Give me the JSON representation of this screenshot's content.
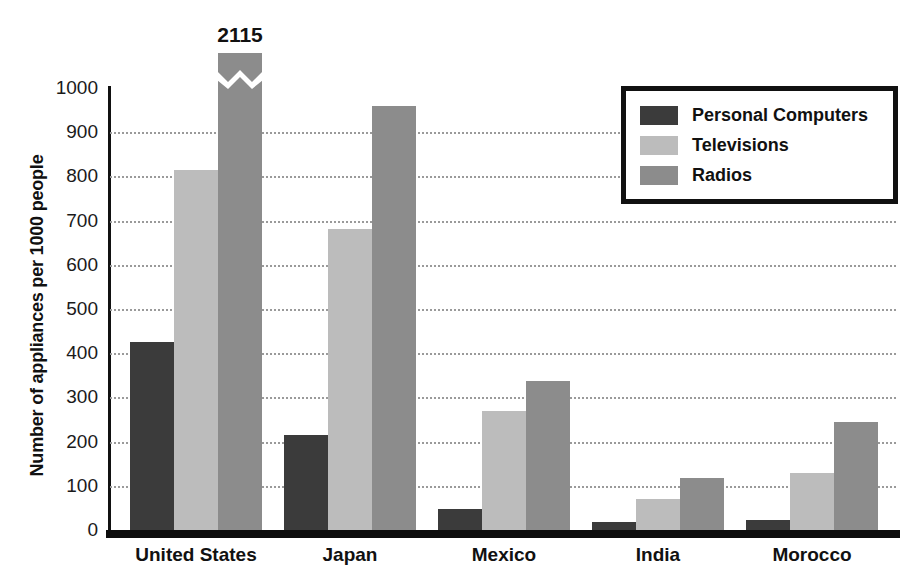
{
  "chart_data": {
    "type": "bar",
    "title": "",
    "xlabel": "",
    "ylabel": "Number of appliances per 1000 people",
    "ylim": [
      0,
      1000
    ],
    "yticks": [
      0,
      100,
      200,
      300,
      400,
      500,
      600,
      700,
      800,
      900,
      1000
    ],
    "grid": true,
    "legend_position": "top-right",
    "categories": [
      "United States",
      "Japan",
      "Mexico",
      "India",
      "Morocco"
    ],
    "series": [
      {
        "name": "Personal Computers",
        "color": "#3b3b3b",
        "values": [
          425,
          215,
          47,
          18,
          22
        ]
      },
      {
        "name": "Televisions",
        "color": "#bcbcbc",
        "values": [
          815,
          680,
          270,
          70,
          130
        ]
      },
      {
        "name": "Radios",
        "color": "#8c8c8c",
        "values": [
          2115,
          960,
          337,
          117,
          245
        ]
      }
    ],
    "annotations": [
      {
        "text": "2115",
        "category": "United States",
        "series": "Radios",
        "note": "bar is truncated with an axis-break zigzag; true value shown above bar"
      }
    ],
    "axis_break": {
      "series": "Radios",
      "category": "United States",
      "display_top": 1080
    }
  },
  "ytick_labels": [
    "1000",
    "900",
    "800",
    "700",
    "600",
    "500",
    "400",
    "300",
    "200",
    "100",
    "0"
  ],
  "legend": {
    "items": [
      {
        "label": "Personal Computers",
        "swatch": "#3b3b3b"
      },
      {
        "label": "Televisions",
        "swatch": "#bcbcbc"
      },
      {
        "label": "Radios",
        "swatch": "#8c8c8c"
      }
    ]
  }
}
